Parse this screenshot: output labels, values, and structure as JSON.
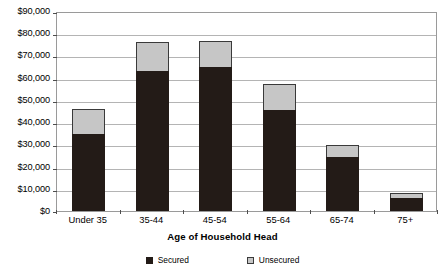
{
  "chart_data": {
    "type": "bar",
    "subtype": "stacked-vertical",
    "title": "",
    "xlabel": "Age of Household Head",
    "ylabel": "",
    "categories": [
      "Under 35",
      "35-44",
      "45-54",
      "55-64",
      "65-74",
      "75+"
    ],
    "series": [
      {
        "name": "Secured",
        "color": "#231b17",
        "values": [
          34500,
          63000,
          65000,
          45500,
          24500,
          5800
        ]
      },
      {
        "name": "Unsecured",
        "color": "#c6c6c6",
        "values": [
          11500,
          13000,
          11500,
          11500,
          5000,
          2200
        ]
      }
    ],
    "totals": [
      46000,
      76000,
      76500,
      57000,
      29500,
      8000
    ],
    "ylim": [
      0,
      90000
    ],
    "ytick_values": [
      0,
      10000,
      20000,
      30000,
      40000,
      50000,
      60000,
      70000,
      80000,
      90000
    ],
    "ytick_labels": [
      "$0",
      "$10,000",
      "$20,000",
      "$30,000",
      "$40,000",
      "$50,000",
      "$60,000",
      "$70,000",
      "$80,000",
      "$90,000"
    ],
    "grid": true,
    "grid_axis": "y",
    "legend_position": "bottom"
  },
  "legend": {
    "entries": [
      {
        "label": "Secured",
        "swatch": "legend-swatch-secured"
      },
      {
        "label": "Unsecured",
        "swatch": "legend-swatch-unsecured"
      }
    ]
  },
  "axis": {
    "x_title": "Age of Household Head"
  },
  "colors": {
    "secured": "#231b17",
    "unsecured": "#c6c6c6",
    "gridline": "#b4b4b4",
    "plot_border": "#9a9a9a",
    "background": "#ffffff"
  }
}
